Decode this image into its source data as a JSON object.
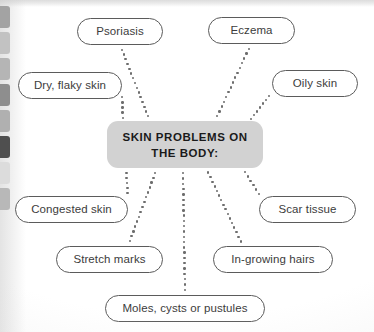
{
  "diagram": {
    "type": "mind-map",
    "center": {
      "lines": [
        "SKIN PROBLEMS ON",
        "THE BODY:"
      ],
      "box": {
        "x": 107,
        "y": 121,
        "w": 156,
        "h": 47
      },
      "fill": "#d2d2d2",
      "text_color": "#1a1a1a"
    },
    "connector_style": {
      "kind": "dotted",
      "dot_color": "#6d6d6d",
      "dot_size": 2.4,
      "spacing": 5.2
    },
    "node_style": {
      "border_color": "#5b5b5b",
      "fill": "#ffffff",
      "text_color": "#3c3c3c"
    },
    "nodes": [
      {
        "id": "psoriasis",
        "label": "Psoriasis",
        "x": 77,
        "y": 18,
        "w": 86,
        "h": 27,
        "anchor_x": 120,
        "anchor_y": 45,
        "target_x": 150,
        "target_y": 121
      },
      {
        "id": "eczema",
        "label": "Eczema",
        "x": 208,
        "y": 17,
        "w": 87,
        "h": 27,
        "anchor_x": 251,
        "anchor_y": 44,
        "target_x": 215,
        "target_y": 121
      },
      {
        "id": "dry-flaky",
        "label": "Dry, flaky skin",
        "x": 18,
        "y": 72,
        "w": 104,
        "h": 27,
        "anchor_x": 122,
        "anchor_y": 92,
        "target_x": 123,
        "target_y": 123
      },
      {
        "id": "oily",
        "label": "Oily skin",
        "x": 272,
        "y": 70,
        "w": 86,
        "h": 27,
        "anchor_x": 272,
        "anchor_y": 92,
        "target_x": 248,
        "target_y": 123
      },
      {
        "id": "congested",
        "label": "Congested skin",
        "x": 15,
        "y": 196,
        "w": 113,
        "h": 27,
        "anchor_x": 128,
        "anchor_y": 198,
        "target_x": 126,
        "target_y": 168
      },
      {
        "id": "scar",
        "label": "Scar tissue",
        "x": 259,
        "y": 196,
        "w": 97,
        "h": 27,
        "anchor_x": 262,
        "anchor_y": 198,
        "target_x": 242,
        "target_y": 168
      },
      {
        "id": "stretch",
        "label": "Stretch marks",
        "x": 56,
        "y": 246,
        "w": 107,
        "h": 27,
        "anchor_x": 128,
        "anchor_y": 246,
        "target_x": 157,
        "target_y": 168
      },
      {
        "id": "ingrowing",
        "label": "In-growing hairs",
        "x": 213,
        "y": 246,
        "w": 120,
        "h": 27,
        "anchor_x": 243,
        "anchor_y": 246,
        "target_x": 206,
        "target_y": 168
      },
      {
        "id": "moles",
        "label": "Moles, cysts or pustules",
        "x": 105,
        "y": 295,
        "w": 160,
        "h": 27,
        "anchor_x": 185,
        "anchor_y": 295,
        "target_x": 183,
        "target_y": 168
      }
    ]
  },
  "page_artifacts": {
    "binding_tabs": [
      {
        "top": 0,
        "height": 22,
        "color": "#a3a3a3"
      },
      {
        "top": 26,
        "height": 22,
        "color": "#c2c2c2"
      },
      {
        "top": 52,
        "height": 22,
        "color": "#b5b5b5"
      },
      {
        "top": 78,
        "height": 22,
        "color": "#8e8e8e"
      },
      {
        "top": 104,
        "height": 22,
        "color": "#b0b0b0"
      },
      {
        "top": 130,
        "height": 22,
        "color": "#4f4f4f"
      },
      {
        "top": 156,
        "height": 22,
        "color": "#dcdcdc"
      },
      {
        "top": 182,
        "height": 22,
        "color": "#b8b8b8"
      }
    ]
  }
}
